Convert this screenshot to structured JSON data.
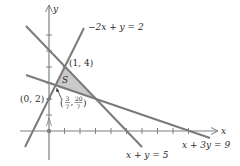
{
  "diagram": {
    "colors": {
      "line": "#7a7a7a",
      "axis": "#808080",
      "shade": "#cacaca",
      "text": "#2a2a2a"
    },
    "axes": {
      "x_label": "x",
      "y_label": "y",
      "x_ticks": [
        1,
        2,
        3,
        4,
        5,
        6,
        7,
        8,
        9
      ],
      "y_ticks": [
        1,
        2,
        3,
        4,
        5,
        6
      ]
    },
    "lines": [
      {
        "id": "line-neg2x-plus-y",
        "label": "−2x + y = 2"
      },
      {
        "id": "line-x-plus-y",
        "label": "x + y = 5"
      },
      {
        "id": "line-x-plus-3y",
        "label": "x + 3y = 9"
      }
    ],
    "region": {
      "label": "S"
    },
    "points": [
      {
        "label": "(1, 4)"
      },
      {
        "label": "(0, 2)"
      },
      {
        "label_num_x": "3",
        "label_den_x": "7",
        "label_num_y": "20",
        "label_den_y": "7"
      }
    ]
  }
}
